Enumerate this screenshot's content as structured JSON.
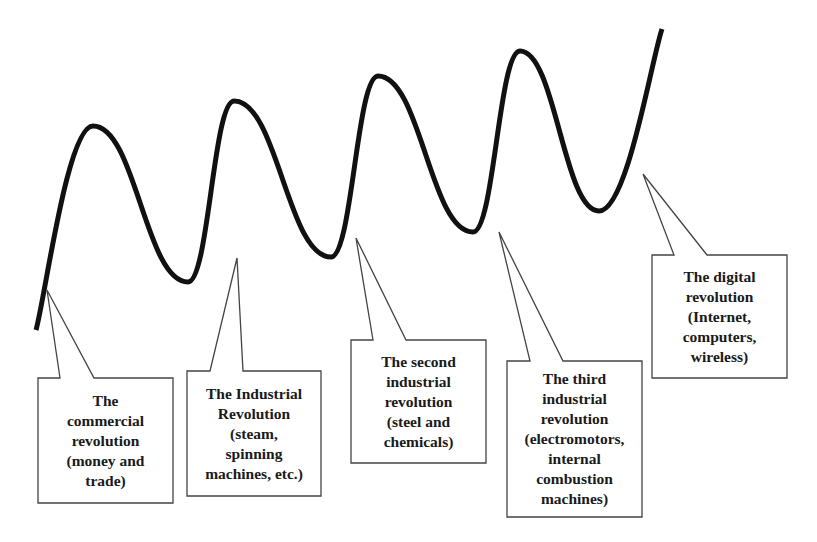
{
  "diagram": {
    "type": "wave-with-callouts",
    "description_visible": "Rising wave curve with five callout boxes marking revolutions",
    "colors": {
      "background": "#ffffff",
      "curve": "#111111",
      "callout_border": "#444444",
      "text": "#1a1a1a"
    },
    "curve_points": [
      [
        36,
        330
      ],
      [
        93,
        126
      ],
      [
        188,
        282
      ],
      [
        234,
        101
      ],
      [
        331,
        257
      ],
      [
        378,
        76
      ],
      [
        473,
        232
      ],
      [
        520,
        51
      ],
      [
        599,
        211
      ],
      [
        662,
        29
      ]
    ],
    "callouts": [
      {
        "id": "commercial",
        "lines": [
          "The",
          "commercial",
          "revolution",
          "(money and",
          "trade)"
        ],
        "box": {
          "x": 38,
          "y": 378,
          "w": 135,
          "h": 125
        },
        "pointer": {
          "tip": [
            47,
            290
          ],
          "base_left": 60,
          "base_right": 94
        }
      },
      {
        "id": "industrial",
        "lines": [
          "The Industrial",
          "Revolution",
          "(steam,",
          "spinning",
          "machines, etc.)"
        ],
        "box": {
          "x": 187,
          "y": 371,
          "w": 134,
          "h": 125
        },
        "pointer": {
          "tip": [
            237,
            258
          ],
          "base_left": 210,
          "base_right": 243
        }
      },
      {
        "id": "second-industrial",
        "lines": [
          "The second",
          "industrial",
          "revolution",
          "(steel and",
          "chemicals)"
        ],
        "box": {
          "x": 351,
          "y": 340,
          "w": 135,
          "h": 123
        },
        "pointer": {
          "tip": [
            356,
            238
          ],
          "base_left": 373,
          "base_right": 406
        }
      },
      {
        "id": "third-industrial",
        "lines": [
          "The third",
          "industrial",
          "revolution",
          "(electromotors,",
          "internal",
          "combustion",
          "machines)"
        ],
        "box": {
          "x": 507,
          "y": 361,
          "w": 135,
          "h": 156
        },
        "pointer": {
          "tip": [
            499,
            232
          ],
          "base_left": 530,
          "base_right": 563
        }
      },
      {
        "id": "digital",
        "lines": [
          "The digital",
          "revolution",
          "(Internet,",
          "computers,",
          "wireless)"
        ],
        "box": {
          "x": 652,
          "y": 255,
          "w": 135,
          "h": 123
        },
        "pointer": {
          "tip": [
            643,
            174
          ],
          "base_left": 674,
          "base_right": 707
        }
      }
    ]
  }
}
